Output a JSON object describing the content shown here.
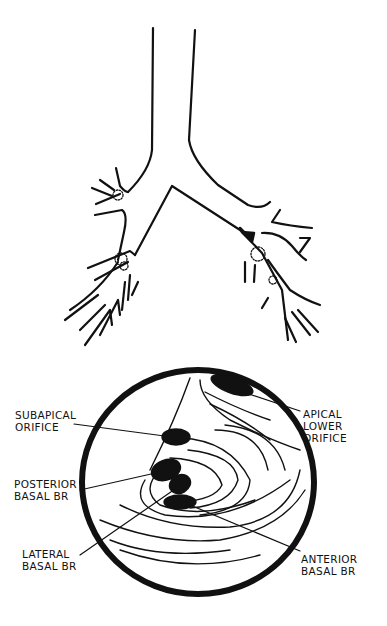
{
  "figure": {
    "type": "medical-line-diagram",
    "top_panel": "bronchial-tree",
    "bottom_panel": "bronchoscopic-view-lower-lobe",
    "colors": {
      "ink": "#111111",
      "background": "#ffffff"
    }
  },
  "labels": {
    "subapical_orifice": "SUBAPICAL\nORIFICE",
    "posterior_basal_br": "POSTERIOR\nBASAL BR",
    "lateral_basal_br": "LATERAL\nBASAL BR",
    "apical_lower_orifice": "APICAL\nLOWER\nORIFICE",
    "anterior_basal_br": "ANTERIOR\nBASAL BR"
  },
  "annotations": {
    "arrow": "arrow-pointing-to-lesion"
  }
}
